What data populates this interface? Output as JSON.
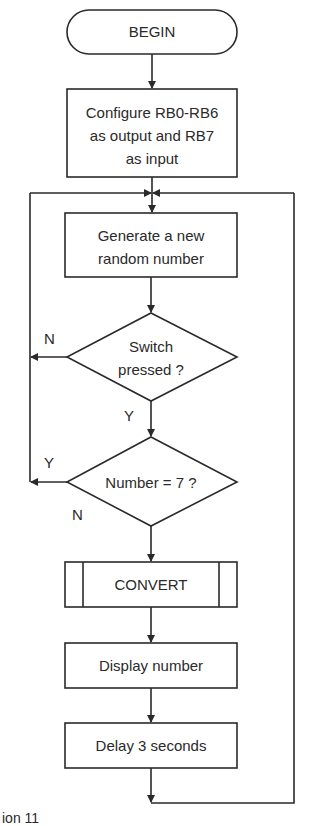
{
  "flowchart": {
    "begin": "BEGIN",
    "configure": {
      "line1": "Configure RB0-RB6",
      "line2": "as output and RB7",
      "line3": "as input"
    },
    "generate": {
      "line1": "Generate a new",
      "line2": "random number"
    },
    "switch_decision": {
      "line1": "Switch",
      "line2": "pressed ?",
      "no_label": "N",
      "yes_label": "Y"
    },
    "number_decision": {
      "text": "Number = 7 ?",
      "yes_label": "Y",
      "no_label": "N"
    },
    "convert": "CONVERT",
    "display": "Display number",
    "delay": "Delay 3 seconds"
  },
  "caption": "ion 11"
}
